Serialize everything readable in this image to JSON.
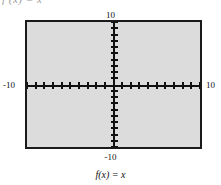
{
  "figure": {
    "clipped_text": "f (x) = x",
    "caption": "f(x) = x"
  },
  "axis_labels": {
    "top": "10",
    "bottom": "-10",
    "left": "-10",
    "right": "10"
  },
  "chart_data": {
    "type": "line",
    "title": "",
    "subtitle": "",
    "caption": "f(x) = x",
    "function": "f(x) = x",
    "xlabel": "",
    "ylabel": "",
    "xlim": [
      -10,
      10
    ],
    "ylim": [
      -10,
      10
    ],
    "x_tick_labels": [
      "-10",
      "10"
    ],
    "y_tick_labels": [
      "-10",
      "10"
    ],
    "x_tick_interval": 1,
    "y_tick_interval": 1,
    "x_ticks": [
      -10,
      -9,
      -8,
      -7,
      -6,
      -5,
      -4,
      -3,
      -2,
      -1,
      1,
      2,
      3,
      4,
      5,
      6,
      7,
      8,
      9,
      10
    ],
    "y_ticks": [
      -10,
      -9,
      -8,
      -7,
      -6,
      -5,
      -4,
      -3,
      -2,
      -1,
      1,
      2,
      3,
      4,
      5,
      6,
      7,
      8,
      9,
      10
    ],
    "grid": false,
    "legend": "none",
    "plot_background": "#dcdcdc",
    "frame_color": "#1a1a1a",
    "axis_color": "#111111",
    "series": [
      {
        "name": "f(x) = x",
        "x": [
          -10,
          10
        ],
        "values": [
          -10,
          10
        ],
        "color": "#111111",
        "visible_in_window": false
      }
    ]
  }
}
